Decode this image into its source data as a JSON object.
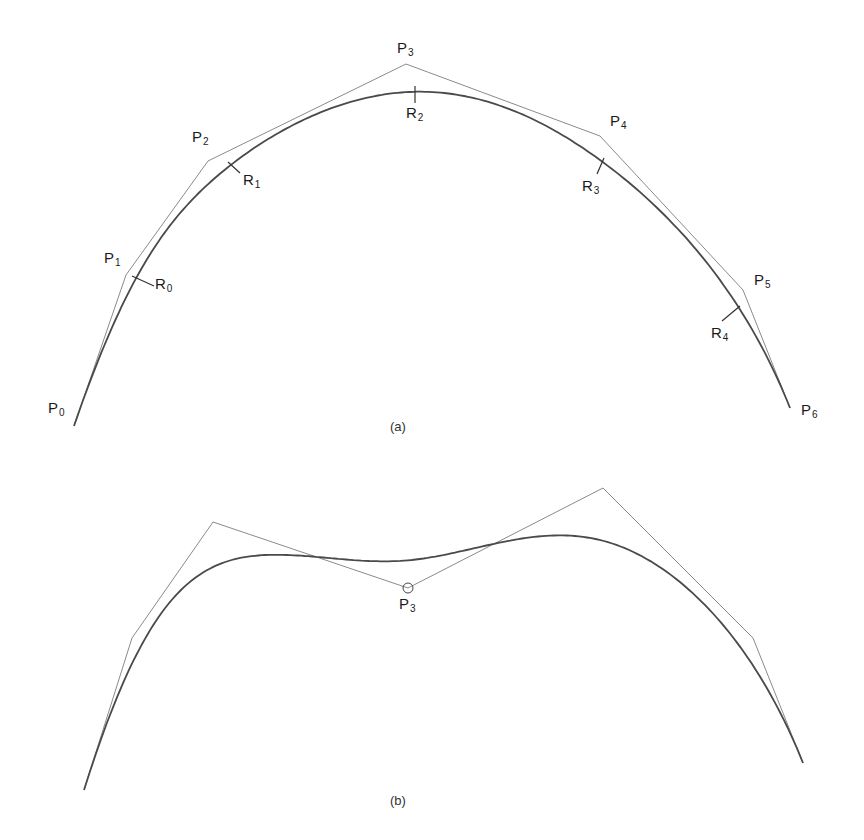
{
  "figure": {
    "panels": [
      {
        "id": "a",
        "caption": "(a)",
        "caption_pos": [
          397,
          420
        ],
        "control_polygon": [
          [
            74,
            426
          ],
          [
            126,
            275
          ],
          [
            208,
            161
          ],
          [
            406,
            64
          ],
          [
            600,
            136
          ],
          [
            743,
            290
          ],
          [
            790,
            408
          ]
        ],
        "point_labels": [
          {
            "base": "P",
            "sub": "0",
            "pos": [
              48,
              400
            ]
          },
          {
            "base": "P",
            "sub": "1",
            "pos": [
              104,
              250
            ]
          },
          {
            "base": "P",
            "sub": "2",
            "pos": [
              192,
              129
            ]
          },
          {
            "base": "P",
            "sub": "3",
            "pos": [
              397,
              40
            ]
          },
          {
            "base": "P",
            "sub": "4",
            "pos": [
              610,
              113
            ]
          },
          {
            "base": "P",
            "sub": "5",
            "pos": [
              754,
              272
            ]
          },
          {
            "base": "P",
            "sub": "6",
            "pos": [
              801,
              402
            ]
          }
        ],
        "join_labels": [
          {
            "base": "R",
            "sub": "0",
            "pos": [
              155,
              276
            ],
            "tick": [
              [
                132,
                276
              ],
              [
                154,
                286
              ]
            ]
          },
          {
            "base": "R",
            "sub": "1",
            "pos": [
              243,
              172
            ],
            "tick": [
              [
                228,
                162
              ],
              [
                240,
                173
              ]
            ]
          },
          {
            "base": "R",
            "sub": "2",
            "pos": [
              406,
              105
            ],
            "tick": [
              [
                415,
                86
              ],
              [
                415,
                103
              ]
            ]
          },
          {
            "base": "R",
            "sub": "3",
            "pos": [
              582,
              178
            ],
            "tick": [
              [
                604,
                158
              ],
              [
                597,
                174
              ]
            ]
          },
          {
            "base": "R",
            "sub": "4",
            "pos": [
              711,
              325
            ],
            "tick": [
              [
                740,
                306
              ],
              [
                722,
                321
              ]
            ]
          }
        ]
      },
      {
        "id": "b",
        "caption": "(b)",
        "caption_pos": [
          397,
          794
        ],
        "control_polygon": [
          [
            84,
            790
          ],
          [
            132,
            638
          ],
          [
            213,
            522
          ],
          [
            408,
            588
          ],
          [
            603,
            488
          ],
          [
            753,
            638
          ],
          [
            803,
            763
          ]
        ],
        "point_labels": [
          {
            "base": "P",
            "sub": "3",
            "pos": [
              399,
              596
            ]
          }
        ],
        "moved_point_marker": {
          "center": [
            408,
            588
          ],
          "radius": 5
        },
        "join_labels": []
      }
    ]
  }
}
